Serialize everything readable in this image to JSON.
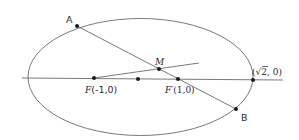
{
  "diagram": {
    "type": "ellipse-focal-chord",
    "ellipse": {
      "cx": 140.5,
      "cy": 77,
      "rx": 112.5,
      "ry": 58.5,
      "stroke": "#6a6a6a"
    },
    "axis": {
      "x1": 22,
      "y1": 78,
      "x2": 283,
      "y2": 80
    },
    "chord_AB": {
      "x1": 77,
      "y1": 26,
      "x2": 236,
      "y2": 109
    },
    "line_FM": {
      "x1": 94,
      "y1": 78,
      "x2": 199,
      "y2": 63
    },
    "points": [
      {
        "id": "A",
        "x": 77,
        "y": 26
      },
      {
        "id": "B",
        "x": 236,
        "y": 109
      },
      {
        "id": "M",
        "x": 159,
        "y": 69
      },
      {
        "id": "F",
        "x": 94,
        "y": 78
      },
      {
        "id": "O",
        "x": 138,
        "y": 79
      },
      {
        "id": "F_prime",
        "x": 178,
        "y": 79
      },
      {
        "id": "vertex",
        "x": 253,
        "y": 80
      }
    ],
    "labels": {
      "A": "A",
      "B": "B",
      "M": "M",
      "F_letter": "F",
      "F_coords": "(-1,0)",
      "F_prime_letter": "F′",
      "F_prime_coords": "(1,0)",
      "vertex_open": "(",
      "vertex_sqrt": "√2",
      "vertex_rest": ", 0)"
    }
  }
}
